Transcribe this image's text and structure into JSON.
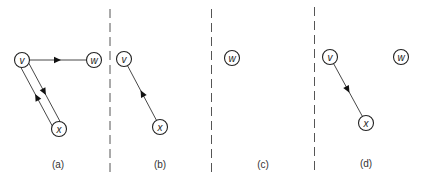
{
  "figure": {
    "panels": [
      {
        "id": "a",
        "label": "(a)",
        "nodes": [
          {
            "id": "v",
            "text": "v"
          },
          {
            "id": "w",
            "text": "w"
          },
          {
            "id": "x",
            "text": "x"
          }
        ],
        "edges": [
          {
            "from": "v",
            "to": "w",
            "directed": true
          },
          {
            "from": "v",
            "to": "x",
            "directed": true
          },
          {
            "from": "x",
            "to": "v",
            "directed": true
          }
        ]
      },
      {
        "id": "b",
        "label": "(b)",
        "nodes": [
          {
            "id": "v",
            "text": "v"
          },
          {
            "id": "x",
            "text": "x"
          }
        ],
        "edges": [
          {
            "from": "x",
            "to": "v",
            "directed": true
          }
        ]
      },
      {
        "id": "c",
        "label": "(c)",
        "nodes": [
          {
            "id": "w",
            "text": "w"
          }
        ],
        "edges": []
      },
      {
        "id": "d",
        "label": "(d)",
        "nodes": [
          {
            "id": "v",
            "text": "v"
          },
          {
            "id": "w",
            "text": "w"
          },
          {
            "id": "x",
            "text": "x"
          }
        ],
        "edges": [
          {
            "from": "v",
            "to": "x",
            "directed": true
          }
        ]
      }
    ]
  }
}
